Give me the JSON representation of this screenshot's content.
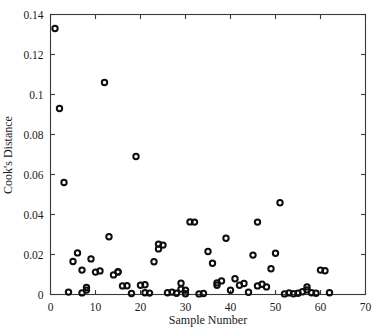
{
  "chart_data": {
    "type": "scatter",
    "title": "",
    "xlabel": "Sample Number",
    "ylabel": "Cook's Distance",
    "xlim": [
      0,
      70
    ],
    "ylim": [
      0,
      0.14
    ],
    "xticks": [
      0,
      10,
      20,
      30,
      40,
      50,
      60,
      70
    ],
    "xtick_labels": [
      "0",
      "10",
      "20",
      "30",
      "40",
      "50",
      "60",
      "70"
    ],
    "yticks": [
      0,
      0.02,
      0.04,
      0.06,
      0.08,
      0.1,
      0.12,
      0.14
    ],
    "ytick_labels": [
      "0",
      "0.02",
      "0.04",
      "0.06",
      "0.08",
      "0.1",
      "0.12",
      "0.14"
    ],
    "grid": false,
    "legend": null,
    "marker": "open-circle",
    "marker_color": "#0d0d0d",
    "series": [
      {
        "name": "Cook's Distance",
        "x": [
          1,
          2,
          3,
          4,
          5,
          6,
          7,
          7,
          8,
          8,
          9,
          10,
          11,
          12,
          13,
          14,
          15,
          15,
          16,
          17,
          18,
          19,
          20,
          21,
          21,
          22,
          23,
          24,
          24,
          25,
          26,
          27,
          28,
          29,
          29,
          30,
          30,
          31,
          32,
          33,
          34,
          35,
          36,
          37,
          37,
          38,
          39,
          40,
          41,
          42,
          43,
          44,
          45,
          46,
          46,
          47,
          48,
          49,
          50,
          51,
          52,
          53,
          54,
          55,
          56,
          57,
          57,
          58,
          59,
          60,
          61,
          62
        ],
        "y": [
          0.133,
          0.093,
          0.056,
          0.0012,
          0.0165,
          0.0208,
          0.0122,
          0.0008,
          0.0022,
          0.0035,
          0.0178,
          0.0112,
          0.0118,
          0.106,
          0.0289,
          0.0098,
          0.0114,
          0.0112,
          0.0043,
          0.0044,
          0.0005,
          0.069,
          0.0046,
          0.0009,
          0.0049,
          0.0007,
          0.0164,
          0.0228,
          0.0252,
          0.0247,
          0.0009,
          0.0012,
          0.0006,
          0.0027,
          0.0056,
          0.0004,
          0.0022,
          0.0363,
          0.0362,
          0.0003,
          0.0005,
          0.0215,
          0.0156,
          0.0046,
          0.0058,
          0.0068,
          0.0281,
          0.0021,
          0.0079,
          0.0046,
          0.0055,
          0.0011,
          0.0197,
          0.0362,
          0.0043,
          0.0051,
          0.0038,
          0.0129,
          0.0206,
          0.0459,
          0.0003,
          0.0008,
          0.0004,
          0.0006,
          0.0014,
          0.0023,
          0.0038,
          0.0009,
          0.0006,
          0.0122,
          0.0119,
          0.0009
        ]
      }
    ]
  },
  "figure": {
    "background_color": "#ffffff",
    "axis_color": "#3a3a3a",
    "marker_edge_color": "#0d0d0d"
  }
}
